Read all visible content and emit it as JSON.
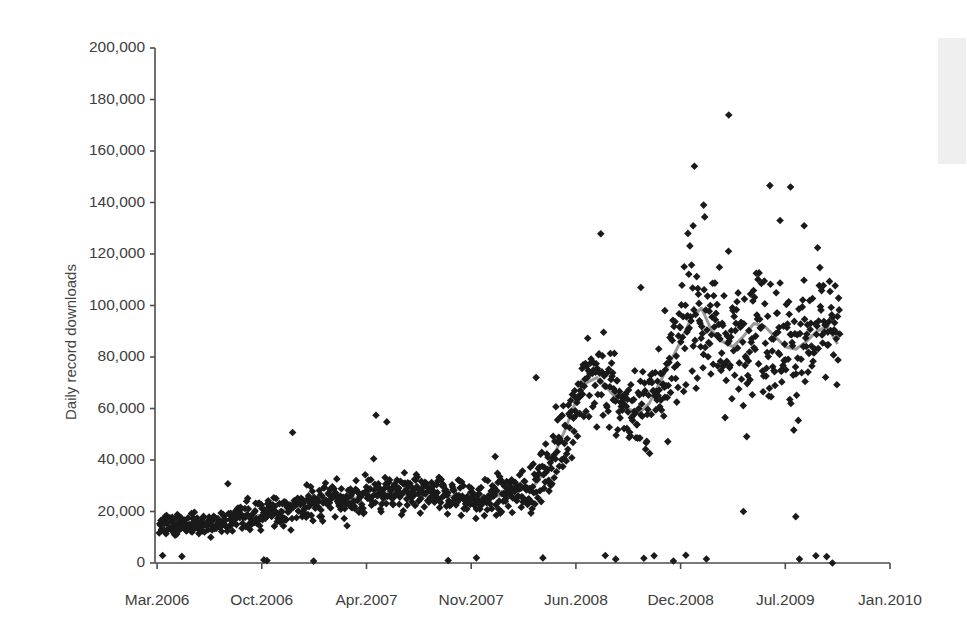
{
  "chart_data": {
    "type": "scatter",
    "title": "",
    "subtitle": "",
    "xlabel": "",
    "ylabel": "Daily record downloads",
    "grid": false,
    "legend": null,
    "ylim": [
      0,
      200000
    ],
    "ytick_labels": [
      "0",
      "20,000",
      "40,000",
      "60,000",
      "80,000",
      "100,000",
      "120,000",
      "140,000",
      "160,000",
      "180,000",
      "200,000"
    ],
    "ytick_values": [
      0,
      20000,
      40000,
      60000,
      80000,
      100000,
      120000,
      140000,
      160000,
      180000,
      200000
    ],
    "xtick_labels": [
      "Mar.2006",
      "Oct.2006",
      "Apr.2007",
      "Nov.2007",
      "Jun.2008",
      "Dec.2008",
      "Jul.2009",
      "Jan.2010"
    ],
    "xtick_index": [
      0,
      1,
      2,
      3,
      4,
      5,
      6,
      7
    ],
    "xlim_index": [
      -0.02,
      7.0
    ],
    "series": [
      {
        "name": "Daily record downloads",
        "type": "scatter",
        "marker": "diamond",
        "color": "#1a1a1a",
        "marker_size": 6,
        "note": "one point per day, Mar 2006 - Sep 2009; daily totals fluctuate widely around a rising baseline"
      },
      {
        "name": "Moving average",
        "type": "line",
        "color": "#9a9a9a",
        "line_width": 3,
        "note": "smoothed trend of daily downloads",
        "trend_x": [
          0.02,
          0.15,
          0.3,
          0.45,
          0.6,
          0.75,
          0.9,
          1.05,
          1.2,
          1.35,
          1.5,
          1.65,
          1.8,
          1.95,
          2.1,
          2.25,
          2.4,
          2.55,
          2.7,
          2.85,
          3.0,
          3.15,
          3.3,
          3.45,
          3.6,
          3.75,
          3.9,
          4.0,
          4.1,
          4.2,
          4.3,
          4.4,
          4.5,
          4.6,
          4.7,
          4.8,
          4.9,
          5.0,
          5.1,
          5.2,
          5.3,
          5.4,
          5.5,
          5.6,
          5.7,
          5.8,
          5.9,
          6.0,
          6.1,
          6.2,
          6.3,
          6.4,
          6.5
        ],
        "trend_y": [
          13000,
          14500,
          15000,
          14500,
          16000,
          17500,
          18000,
          19000,
          20500,
          22000,
          23500,
          25000,
          24500,
          25500,
          27000,
          27500,
          26500,
          26000,
          25500,
          26000,
          24500,
          25000,
          26500,
          28000,
          30000,
          38000,
          52000,
          63000,
          70000,
          72000,
          68000,
          63000,
          60000,
          58000,
          62000,
          70000,
          78000,
          86000,
          95000,
          99000,
          90000,
          86000,
          84000,
          88000,
          93000,
          92000,
          88000,
          84000,
          83000,
          86000,
          90000,
          92000,
          85000
        ]
      }
    ],
    "annotations": [
      {
        "text": "peak outlier",
        "value": 174000
      },
      {
        "text": "secondary peaks",
        "value": 146000
      }
    ],
    "x_span_days": 1290,
    "x_start": "2006-03-01",
    "x_end": "2009-09-15"
  },
  "figure": {
    "background_color": "#ffffff",
    "axis_color": "#4d4d4d",
    "marker_color": "#1a1a1a",
    "trend_color": "#9a9a9a",
    "plot_left": 155,
    "plot_right": 890,
    "plot_top": 48,
    "plot_bottom": 563
  }
}
